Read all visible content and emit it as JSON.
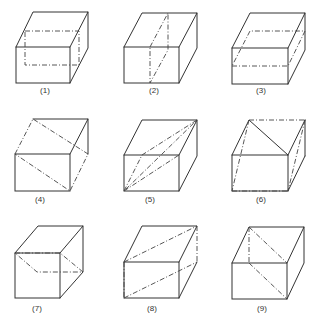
{
  "figure": {
    "line_color": "#333333",
    "labels": [
      "(1)",
      "(2)",
      "(3)",
      "(4)",
      "(5)",
      "(6)",
      "(7)",
      "(8)",
      "(9)"
    ]
  },
  "cubes": [
    {
      "label": "(1)",
      "section": "vertical plane parallel to front face (through back-middle)"
    },
    {
      "label": "(2)",
      "section": "vertical plane through middle of front and back edges (diagonal of top)"
    },
    {
      "label": "(3)",
      "section": "horizontal plane at mid-height"
    },
    {
      "label": "(4)",
      "section": "slanted plane through top-back-left edge and front-bottom-right edge"
    },
    {
      "label": "(5)",
      "section": "diagonal plane from bottom-front-left through top-back-right"
    },
    {
      "label": "(6)",
      "section": "diagonal plane through top-back edge and bottom-front edge"
    },
    {
      "label": "(7)",
      "section": "horizontal-to-slanted plane from front-top-left edge to back mid-right"
    },
    {
      "label": "(8)",
      "section": "diagonal plane through left-front vertical edge and right-back vertical edge"
    },
    {
      "label": "(9)",
      "section": "vertical diagonal plane through top-back-left and bottom-front-right"
    }
  ]
}
